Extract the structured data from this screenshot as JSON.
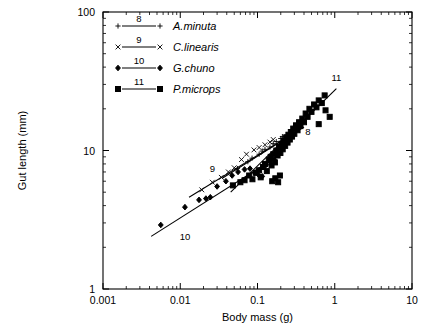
{
  "chart_data": {
    "type": "scatter",
    "title": "",
    "xlabel": "Body mass (g)",
    "ylabel": "Gut length (mm)",
    "xscale": "log",
    "yscale": "log",
    "xlim": [
      0.001,
      10
    ],
    "ylim": [
      1,
      100
    ],
    "xticks": [
      "0.001",
      "0.01",
      "0.1",
      "1",
      "10"
    ],
    "xtick_values": [
      0.001,
      0.01,
      0.1,
      1,
      10
    ],
    "yticks": [
      "1",
      "10",
      "100"
    ],
    "ytick_values": [
      1,
      10,
      100
    ],
    "grid": false,
    "minor_ticks": true,
    "legend_position": "top-left-inside",
    "series": [
      {
        "name": "A.minuta",
        "number": "8",
        "marker": "plus",
        "points": [
          [
            0.055,
            7.4
          ],
          [
            0.075,
            8.3
          ],
          [
            0.085,
            8.8
          ],
          [
            0.105,
            9.4
          ],
          [
            0.115,
            9.9
          ],
          [
            0.125,
            10.2
          ],
          [
            0.145,
            10.6
          ],
          [
            0.16,
            11.2
          ],
          [
            0.175,
            11.6
          ],
          [
            0.2,
            12.2
          ],
          [
            0.21,
            12.6
          ],
          [
            0.235,
            13.0
          ]
        ],
        "fit_line": {
          "x": [
            0.035,
            0.4
          ],
          "y": [
            6.3,
            14.8
          ]
        }
      },
      {
        "name": "C.linearis",
        "number": "9",
        "marker": "cross",
        "points": [
          [
            0.019,
            5.2
          ],
          [
            0.026,
            5.9
          ],
          [
            0.034,
            6.4
          ],
          [
            0.042,
            7.0
          ],
          [
            0.05,
            7.5
          ],
          [
            0.062,
            8.6
          ],
          [
            0.072,
            9.4
          ],
          [
            0.09,
            10.1
          ],
          [
            0.105,
            10.5
          ],
          [
            0.125,
            11.0
          ],
          [
            0.145,
            11.5
          ],
          [
            0.16,
            12.0
          ]
        ],
        "fit_line": {
          "x": [
            0.013,
            0.26
          ],
          "y": [
            4.6,
            12.8
          ]
        }
      },
      {
        "name": "G.chuno",
        "number": "10",
        "marker": "diamond",
        "points": [
          [
            0.0056,
            2.9
          ],
          [
            0.0115,
            3.9
          ],
          [
            0.0175,
            4.4
          ],
          [
            0.0215,
            4.5
          ],
          [
            0.0245,
            4.6
          ],
          [
            0.03,
            5.5
          ],
          [
            0.039,
            6.0
          ],
          [
            0.047,
            6.6
          ],
          [
            0.056,
            7.0
          ],
          [
            0.068,
            7.3
          ],
          [
            0.08,
            7.4
          ],
          [
            0.092,
            6.9
          ],
          [
            0.105,
            6.6
          ],
          [
            0.115,
            6.5
          ],
          [
            0.13,
            7.9
          ],
          [
            0.145,
            8.3
          ],
          [
            0.165,
            8.6
          ]
        ],
        "fit_line": {
          "x": [
            0.0042,
            0.2
          ],
          "y": [
            2.4,
            9.4
          ]
        }
      },
      {
        "name": "P.microps",
        "number": "11",
        "marker": "square",
        "points": [
          [
            0.048,
            5.6
          ],
          [
            0.06,
            5.9
          ],
          [
            0.068,
            6.1
          ],
          [
            0.078,
            6.6
          ],
          [
            0.086,
            6.2
          ],
          [
            0.095,
            6.9
          ],
          [
            0.105,
            7.2
          ],
          [
            0.11,
            6.4
          ],
          [
            0.118,
            7.6
          ],
          [
            0.125,
            8.0
          ],
          [
            0.132,
            7.1
          ],
          [
            0.14,
            8.6
          ],
          [
            0.148,
            9.0
          ],
          [
            0.152,
            7.8
          ],
          [
            0.16,
            9.4
          ],
          [
            0.168,
            8.2
          ],
          [
            0.175,
            10.0
          ],
          [
            0.182,
            9.2
          ],
          [
            0.19,
            10.6
          ],
          [
            0.198,
            9.6
          ],
          [
            0.205,
            11.2
          ],
          [
            0.212,
            10.2
          ],
          [
            0.22,
            11.8
          ],
          [
            0.228,
            10.8
          ],
          [
            0.235,
            12.4
          ],
          [
            0.245,
            11.4
          ],
          [
            0.252,
            13.0
          ],
          [
            0.262,
            12.0
          ],
          [
            0.27,
            13.6
          ],
          [
            0.28,
            12.6
          ],
          [
            0.29,
            14.4
          ],
          [
            0.3,
            13.2
          ],
          [
            0.315,
            15.2
          ],
          [
            0.33,
            14.0
          ],
          [
            0.345,
            16.0
          ],
          [
            0.36,
            15.0
          ],
          [
            0.38,
            17.0
          ],
          [
            0.4,
            16.0
          ],
          [
            0.42,
            18.5
          ],
          [
            0.445,
            17.5
          ],
          [
            0.47,
            20.0
          ],
          [
            0.5,
            19.0
          ],
          [
            0.54,
            21.5
          ],
          [
            0.58,
            20.5
          ],
          [
            0.62,
            23.0
          ],
          [
            0.68,
            22.0
          ],
          [
            0.74,
            25.0
          ],
          [
            0.155,
            6.0
          ],
          [
            0.17,
            6.3
          ],
          [
            0.185,
            5.9
          ],
          [
            0.195,
            6.6
          ],
          [
            0.86,
            17.5
          ],
          [
            0.76,
            19.5
          ],
          [
            0.62,
            15.5
          ]
        ],
        "fit_line": {
          "x": [
            0.045,
            1.05
          ],
          "y": [
            5.0,
            28.0
          ]
        }
      }
    ],
    "line_annotations": [
      {
        "label": "8",
        "x": 0.45,
        "y": 13.0
      },
      {
        "label": "9",
        "x": 0.026,
        "y": 7.0
      },
      {
        "label": "10",
        "x": 0.0115,
        "y": 2.25
      },
      {
        "label": "11",
        "x": 1.05,
        "y": 32.0
      }
    ]
  },
  "legend": {
    "entries": [
      {
        "number": "8",
        "name": "A.minuta",
        "marker": "plus"
      },
      {
        "number": "9",
        "name": "C.linearis",
        "marker": "cross"
      },
      {
        "number": "10",
        "name": "G.chuno",
        "marker": "diamond"
      },
      {
        "number": "11",
        "name": "P.microps",
        "marker": "square"
      }
    ]
  },
  "colors": {
    "ink": "#000000",
    "background": "#ffffff"
  }
}
